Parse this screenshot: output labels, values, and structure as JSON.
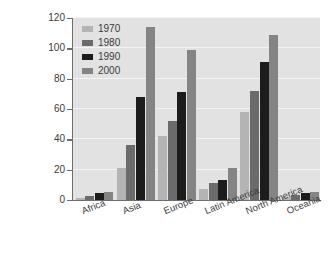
{
  "chart_data": {
    "type": "bar",
    "title": "",
    "xlabel": "",
    "ylabel": "Millions of tons of paper and paperboard consumed",
    "ylim": [
      0,
      120
    ],
    "yticks": [
      0,
      20,
      40,
      60,
      80,
      100,
      120
    ],
    "grid": true,
    "legend_position": "top-left",
    "categories": [
      "Africa",
      "Asia",
      "Europe",
      "Latin America",
      "North America",
      "Oceania"
    ],
    "series": [
      {
        "name": "1970",
        "color": "#b4b4b4",
        "values": [
          1.5,
          21,
          42,
          7,
          58,
          2
        ]
      },
      {
        "name": "1980",
        "color": "#6b6b6b",
        "values": [
          2.5,
          36,
          52,
          11,
          72,
          3.5
        ]
      },
      {
        "name": "1990",
        "color": "#1c1c1c",
        "values": [
          4.5,
          68,
          71,
          13,
          91,
          4.5
        ]
      },
      {
        "name": "2000",
        "color": "#848484",
        "values": [
          5.5,
          114,
          99,
          21,
          109,
          5
        ]
      }
    ]
  },
  "colors": {
    "plot_background": "#e2e2e2",
    "gridline": "#f4f4f4",
    "axis": "#6e6e6e",
    "text": "#3a3a3a",
    "page_background": "#ffffff"
  }
}
